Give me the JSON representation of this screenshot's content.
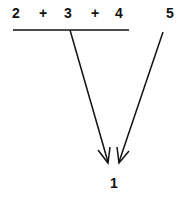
{
  "diagram": {
    "expression_terms": [
      "2",
      "+",
      "3",
      "+",
      "4"
    ],
    "separate_term": "5",
    "result": "1",
    "colors": {
      "ink": "#111111",
      "background": "#ffffff"
    }
  }
}
